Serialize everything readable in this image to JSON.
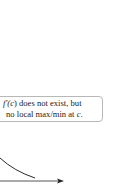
{
  "callout": {
    "line1_prefix": "f′(",
    "line1_var": "c",
    "line1_suffix": ") does not exist, but",
    "line2_prefix": "no local max/min at ",
    "line2_var": "c",
    "line2_suffix": "."
  },
  "colors": {
    "curve": "#2a2a2a",
    "axis": "#555555",
    "box_border": "#b8b8b8",
    "text": "#222222"
  }
}
